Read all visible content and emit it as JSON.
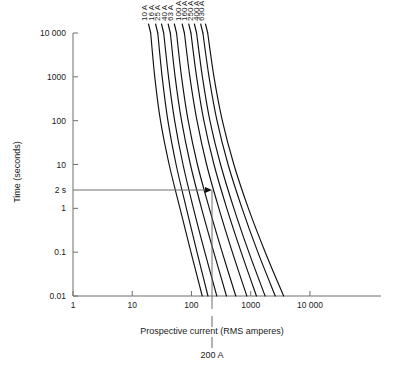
{
  "chart_data": {
    "type": "line",
    "title": "",
    "xlabel": "Prospective current  (RMS amperes)",
    "ylabel": "Time (seconds)",
    "xscale": "log",
    "yscale": "log",
    "xlim": [
      1,
      158489
    ],
    "ylim": [
      0.01,
      10000
    ],
    "grid": false,
    "legend_position": "inline-curve-labels",
    "xticks": [
      1,
      10,
      100,
      1000,
      10000
    ],
    "xticklabels": [
      "1",
      "10",
      "100",
      "1000",
      "10 000"
    ],
    "yticks": [
      0.01,
      0.1,
      1,
      10,
      100,
      1000,
      10000
    ],
    "yticklabels": [
      "0.01",
      "0.1",
      "1",
      "10",
      "100",
      "1000",
      "10 000"
    ],
    "extra_ytick": {
      "value": 2,
      "label": "2 s"
    },
    "series": [
      {
        "name": "10 A",
        "label": "10 A",
        "x": [
          20.5,
          24,
          30,
          42,
          64,
          98,
          152
        ],
        "y": [
          10000,
          1000,
          100,
          10,
          1,
          0.1,
          0.01
        ]
      },
      {
        "name": "16 A",
        "label": "16 A",
        "x": [
          27,
          32,
          40,
          55,
          82,
          124,
          190
        ],
        "y": [
          10000,
          1000,
          100,
          10,
          1,
          0.1,
          0.01
        ]
      },
      {
        "name": "25 A",
        "label": "25 A",
        "x": [
          34,
          41,
          52,
          72,
          108,
          168,
          268
        ],
        "y": [
          10000,
          1000,
          100,
          10,
          1,
          0.1,
          0.01
        ]
      },
      {
        "name": "40 A",
        "label": "40 A",
        "x": [
          44,
          53,
          68,
          96,
          148,
          238,
          390
        ],
        "y": [
          10000,
          1000,
          100,
          10,
          1,
          0.1,
          0.01
        ]
      },
      {
        "name": "63 A",
        "label": "63 A",
        "x": [
          56,
          68,
          88,
          126,
          200,
          330,
          560
        ],
        "y": [
          10000,
          1000,
          100,
          10,
          1,
          0.1,
          0.01
        ]
      },
      {
        "name": "100 A",
        "label": "100 A",
        "x": [
          76,
          94,
          124,
          180,
          290,
          490,
          860
        ],
        "y": [
          10000,
          1000,
          100,
          10,
          1,
          0.1,
          0.01
        ]
      },
      {
        "name": "160 A",
        "label": "160 A",
        "x": [
          98,
          122,
          162,
          240,
          395,
          690,
          1250
        ],
        "y": [
          10000,
          1000,
          100,
          10,
          1,
          0.1,
          0.01
        ]
      },
      {
        "name": "250 A",
        "label": "250 A",
        "x": [
          122,
          153,
          205,
          310,
          520,
          930,
          1750
        ],
        "y": [
          10000,
          1000,
          100,
          10,
          1,
          0.1,
          0.01
        ]
      },
      {
        "name": "400 A",
        "label": "400 A",
        "x": [
          156,
          198,
          270,
          415,
          715,
          1320,
          2600
        ],
        "y": [
          10000,
          1000,
          100,
          10,
          1,
          0.1,
          0.01
        ]
      },
      {
        "name": "630 A",
        "label": "630 A",
        "x": [
          188,
          240,
          332,
          520,
          915,
          1760,
          3600
        ],
        "y": [
          10000,
          1000,
          100,
          10,
          1,
          0.1,
          0.01
        ]
      }
    ],
    "annotations": [
      {
        "name": "operating-point",
        "type": "crosshair",
        "x": 200,
        "y": 2,
        "x_label": "200 A",
        "y_label": "2 s",
        "description": "Arrow from 2 s on the time axis to the 100 A curve at 200 A prospective current"
      }
    ]
  },
  "labels": {
    "ylabel": "Time (seconds)",
    "xlabel": "Prospective current  (RMS amperes)",
    "marker_time": "2 s",
    "marker_current": "200 A"
  },
  "yticklabels": [
    "10 000",
    "1000",
    "100",
    "10",
    "1",
    "0.1",
    "0.01"
  ],
  "xticklabels": [
    "1",
    "10",
    "100",
    "1000",
    "10 000"
  ],
  "curve_labels": [
    "10 A",
    "16 A",
    "25 A",
    "40 A",
    "63 A",
    "100 A",
    "160 A",
    "250 A",
    "400 A",
    "630 A"
  ],
  "colors": {
    "curve": "#111111",
    "axis": "#6f6f6f",
    "text": "#1a1a1a",
    "background": "#ffffff"
  }
}
